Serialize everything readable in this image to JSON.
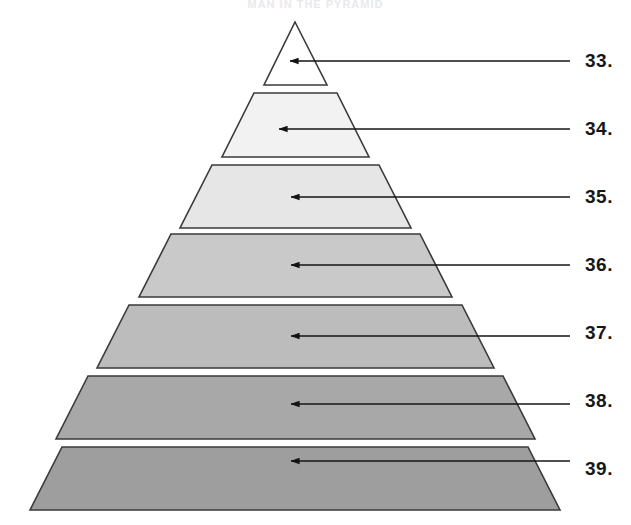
{
  "figure": {
    "type": "pyramid-diagram",
    "title_artifact": "MAN IN THE PYRAMID",
    "tier_count": 7,
    "background_color": "#ffffff",
    "outline_color": "#3a3a3a",
    "arrow_color": "#1a1a1a",
    "label_color": "#171717",
    "tiers": [
      {
        "index": 1,
        "label": "33.",
        "fill": "#ffffff",
        "apex_x": 295,
        "top_y": 22,
        "bottom_y": 85,
        "top_left_x": 295,
        "top_right_x": 295,
        "bottom_left_x": 264,
        "bottom_right_x": 327,
        "arrow_tip_x": 289,
        "arrow_y": 61,
        "arrow_tail_x": 570
      },
      {
        "index": 2,
        "label": "34.",
        "fill": "#f2f2f2",
        "top_y": 93,
        "bottom_y": 157,
        "top_left_x": 254,
        "top_right_x": 337,
        "bottom_left_x": 222,
        "bottom_right_x": 369,
        "arrow_tip_x": 278,
        "arrow_y": 129,
        "arrow_tail_x": 570
      },
      {
        "index": 3,
        "label": "35.",
        "fill": "#e6e6e6",
        "top_y": 165,
        "bottom_y": 228,
        "top_left_x": 212,
        "top_right_x": 379,
        "bottom_left_x": 180,
        "bottom_right_x": 411,
        "arrow_tip_x": 290,
        "arrow_y": 197,
        "arrow_tail_x": 570
      },
      {
        "index": 4,
        "label": "36.",
        "fill": "#c9c9c9",
        "top_y": 234,
        "bottom_y": 297,
        "top_left_x": 171,
        "top_right_x": 420,
        "bottom_left_x": 139,
        "bottom_right_x": 452,
        "arrow_tip_x": 290,
        "arrow_y": 265,
        "arrow_tail_x": 570
      },
      {
        "index": 5,
        "label": "37.",
        "fill": "#bcbcbc",
        "top_y": 305,
        "bottom_y": 368,
        "top_left_x": 129,
        "top_right_x": 462,
        "bottom_left_x": 97,
        "bottom_right_x": 494,
        "arrow_tip_x": 290,
        "arrow_y": 336,
        "arrow_tail_x": 570
      },
      {
        "index": 6,
        "label": "38.",
        "fill": "#a8a8a8",
        "top_y": 376,
        "bottom_y": 439,
        "top_left_x": 88,
        "top_right_x": 503,
        "bottom_left_x": 56,
        "bottom_right_x": 535,
        "arrow_tip_x": 290,
        "arrow_y": 404,
        "arrow_tail_x": 570
      },
      {
        "index": 7,
        "label": "39.",
        "fill": "#9e9e9e",
        "top_y": 447,
        "bottom_y": 510,
        "top_left_x": 62,
        "top_right_x": 528,
        "bottom_left_x": 30,
        "bottom_right_x": 560,
        "arrow_tip_x": 290,
        "arrow_y": 461,
        "arrow_tail_x": 570
      }
    ],
    "labels": [
      {
        "text": "33.",
        "x": 585,
        "y": 50
      },
      {
        "text": "34.",
        "x": 585,
        "y": 118
      },
      {
        "text": "35.",
        "x": 585,
        "y": 186
      },
      {
        "text": "36.",
        "x": 585,
        "y": 254
      },
      {
        "text": "37.",
        "x": 585,
        "y": 322
      },
      {
        "text": "38.",
        "x": 585,
        "y": 390
      },
      {
        "text": "39.",
        "x": 585,
        "y": 458
      }
    ]
  }
}
